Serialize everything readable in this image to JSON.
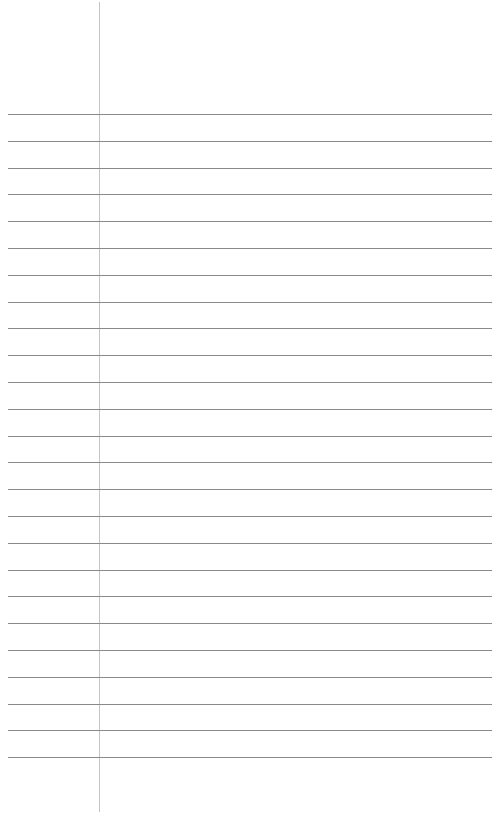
{
  "paper": {
    "type": "ruled notepaper",
    "line_count": 25,
    "first_line_y": 114,
    "line_spacing": 26.8,
    "margin_x": 99,
    "colors": {
      "background": "#ffffff",
      "rule": "#8a8a8a",
      "margin": "#c4c4c4"
    }
  }
}
